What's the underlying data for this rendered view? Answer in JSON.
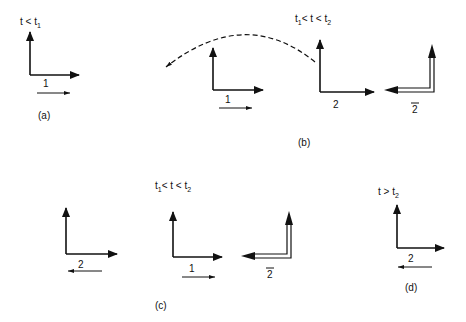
{
  "figure": {
    "panels": [
      {
        "id": "a",
        "caption": "(a)",
        "time_label": {
          "prefix": "t < t",
          "sub": "1"
        },
        "frames": [
          {
            "type": "single",
            "vector_label": "1",
            "vector_dir": "right"
          }
        ]
      },
      {
        "id": "b",
        "caption": "(b)",
        "time_label": {
          "pre": "t",
          "pre_sub": "1",
          "mid": "< t < t",
          "sub": "2"
        },
        "frames": [
          {
            "type": "single",
            "vector_label": "1",
            "vector_dir": "right"
          },
          {
            "type": "single",
            "vector_label": "2"
          },
          {
            "type": "double",
            "vector_label": "2",
            "overbar": true
          }
        ],
        "arc": "dashed arrow from frame 2 to frame 1"
      },
      {
        "id": "c",
        "caption": "(c)",
        "time_label": {
          "pre": "t",
          "pre_sub": "1",
          "mid": "< t < t",
          "sub": "2"
        },
        "frames": [
          {
            "type": "single",
            "vector_label": "2",
            "vector_dir": "left"
          },
          {
            "type": "single",
            "vector_label": "1",
            "vector_dir": "right"
          },
          {
            "type": "double",
            "vector_label": "2",
            "overbar": true
          }
        ]
      },
      {
        "id": "d",
        "caption": "(d)",
        "time_label": {
          "prefix": "t  >  t",
          "sub": "2"
        },
        "frames": [
          {
            "type": "single",
            "vector_label": "2",
            "vector_dir": "left"
          }
        ]
      }
    ]
  }
}
